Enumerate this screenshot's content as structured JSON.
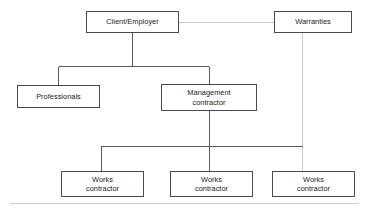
{
  "diagram": {
    "type": "organisational-chart",
    "background_color": "#ffffff",
    "box_border_color": "#4a4a4a",
    "solid_connector_color": "#5a5a5a",
    "faint_connector_color": "#c9c9c9",
    "footer_rule_color": "#d0d0d0",
    "nodes": [
      {
        "id": "client-employer",
        "label": "Client/Employer",
        "x": 86,
        "y": 11,
        "width": 93,
        "height": 22
      },
      {
        "id": "warranties",
        "label": "Warranties",
        "x": 274,
        "y": 11,
        "width": 78,
        "height": 22
      },
      {
        "id": "professionals",
        "label": "Professionals",
        "x": 17,
        "y": 85,
        "width": 83,
        "height": 23
      },
      {
        "id": "management-contractor",
        "label": "Management\ncontractor",
        "x": 161,
        "y": 84,
        "width": 96,
        "height": 27
      },
      {
        "id": "works-contractor-1",
        "label": "Works\ncontractor",
        "x": 61,
        "y": 171,
        "width": 83,
        "height": 26
      },
      {
        "id": "works-contractor-2",
        "label": "Works\ncontractor",
        "x": 170,
        "y": 171,
        "width": 83,
        "height": 26
      },
      {
        "id": "works-contractor-3",
        "label": "Works\ncontractor",
        "x": 272,
        "y": 171,
        "width": 83,
        "height": 26
      }
    ],
    "connectors": [
      {
        "id": "client-to-warranties",
        "style": "faint",
        "from": "client-employer",
        "to": "warranties"
      },
      {
        "id": "client-trunk",
        "style": "solid",
        "from": "client-employer",
        "to": "branch-bus-upper"
      },
      {
        "id": "bus-to-professionals",
        "style": "solid",
        "from": "branch-bus-upper",
        "to": "professionals"
      },
      {
        "id": "bus-to-management-contractor",
        "style": "solid",
        "from": "branch-bus-upper",
        "to": "management-contractor"
      },
      {
        "id": "management-trunk",
        "style": "solid",
        "from": "management-contractor",
        "to": "branch-bus-lower"
      },
      {
        "id": "bus-to-works-contractor-1",
        "style": "solid",
        "from": "branch-bus-lower",
        "to": "works-contractor-1"
      },
      {
        "id": "bus-to-works-contractor-2",
        "style": "solid",
        "from": "branch-bus-lower",
        "to": "works-contractor-2"
      },
      {
        "id": "warranties-to-works-contractor-3",
        "style": "faint",
        "from": "warranties",
        "to": "works-contractor-3"
      }
    ],
    "footer_rule": {
      "visible": true
    }
  }
}
